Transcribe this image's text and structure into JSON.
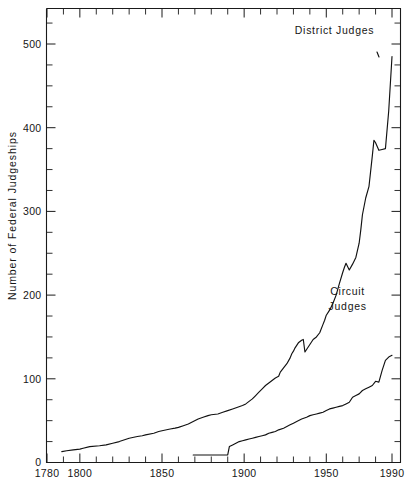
{
  "chart_data": {
    "type": "line",
    "title": "",
    "xlabel": "",
    "ylabel": "Number  of  Federal  Judgeships",
    "xlim": [
      1780,
      1995
    ],
    "ylim": [
      0,
      540
    ],
    "grid": false,
    "legend_position": "inline-annotation",
    "x_ticks_major": [
      1780,
      1800,
      1850,
      1900,
      1950,
      1990
    ],
    "x_tick_labels": [
      "1780",
      "1800",
      "1850",
      "1900",
      "1950",
      "1990"
    ],
    "x_tick_minor_step": 10,
    "y_ticks_major": [
      0,
      100,
      200,
      300,
      400,
      500
    ],
    "y_tick_labels": [
      "0",
      "100",
      "200",
      "300",
      "400",
      "500"
    ],
    "y_tick_minor_step": 25,
    "annotations": [
      {
        "text": "District  Judges",
        "x": 1955,
        "y": 512
      },
      {
        "text": "Circuit",
        "x": 1963,
        "y": 200
      },
      {
        "text": "Judges",
        "x": 1963,
        "y": 182
      }
    ],
    "series": [
      {
        "name": "District Judges",
        "label": "District  Judges",
        "color": "#111111",
        "x": [
          1789,
          1792,
          1796,
          1800,
          1802,
          1806,
          1812,
          1816,
          1820,
          1824,
          1830,
          1835,
          1838,
          1840,
          1845,
          1848,
          1850,
          1855,
          1858,
          1860,
          1863,
          1866,
          1869,
          1872,
          1875,
          1878,
          1880,
          1884,
          1887,
          1890,
          1893,
          1896,
          1899,
          1901,
          1903,
          1905,
          1907,
          1909,
          1911,
          1913,
          1915,
          1917,
          1919,
          1921,
          1922,
          1924,
          1926,
          1928,
          1929,
          1930,
          1931,
          1932,
          1933,
          1935,
          1936,
          1937,
          1938,
          1939,
          1940,
          1941,
          1942,
          1944,
          1946,
          1948,
          1949,
          1950,
          1952,
          1954,
          1956,
          1958,
          1960,
          1961,
          1962,
          1964,
          1966,
          1968,
          1970,
          1971,
          1972,
          1974,
          1976,
          1978,
          1979,
          1980,
          1982,
          1984,
          1986,
          1988,
          1990
        ],
        "y": [
          13,
          14,
          15,
          16,
          17,
          19,
          20,
          21,
          23,
          25,
          29,
          31,
          32,
          33,
          35,
          37,
          38,
          40,
          41,
          42,
          44,
          46,
          49,
          52,
          54,
          56,
          57,
          58,
          60,
          62,
          64,
          66,
          68,
          70,
          73,
          76,
          80,
          84,
          88,
          92,
          95,
          98,
          101,
          103,
          108,
          113,
          118,
          125,
          130,
          133,
          137,
          140,
          143,
          146,
          147,
          132,
          135,
          138,
          141,
          144,
          147,
          150,
          155,
          165,
          170,
          176,
          182,
          190,
          200,
          214,
          227,
          233,
          238,
          230,
          237,
          245,
          262,
          278,
          296,
          316,
          330,
          366,
          385,
          382,
          373,
          374,
          375,
          420,
          485
        ],
        "line_style": "solid"
      },
      {
        "name": "Circuit Judges",
        "label": "Circuit Judges",
        "color": "#111111",
        "x": [
          1869,
          1878,
          1882,
          1886,
          1890,
          1891,
          1893,
          1895,
          1897,
          1899,
          1901,
          1903,
          1905,
          1907,
          1909,
          1911,
          1913,
          1915,
          1917,
          1919,
          1921,
          1924,
          1926,
          1928,
          1930,
          1932,
          1935,
          1938,
          1940,
          1942,
          1944,
          1946,
          1948,
          1950,
          1952,
          1954,
          1956,
          1958,
          1960,
          1962,
          1964,
          1966,
          1968,
          1970,
          1972,
          1974,
          1976,
          1978,
          1980,
          1982,
          1984,
          1986,
          1988,
          1990
        ],
        "y": [
          9,
          9,
          9,
          9,
          9,
          19,
          21,
          23,
          25,
          26,
          27,
          28,
          29,
          30,
          31,
          32,
          33,
          35,
          36,
          37,
          39,
          41,
          43,
          45,
          47,
          49,
          52,
          54,
          56,
          57,
          58,
          59,
          60,
          62,
          64,
          65,
          66,
          67,
          68,
          70,
          72,
          78,
          80,
          82,
          86,
          88,
          90,
          92,
          97,
          96,
          110,
          122,
          126,
          128
        ],
        "line_style": "solid"
      }
    ]
  },
  "axes": {
    "y_axis_title": "Number  of  Federal  Judgeships"
  },
  "caption": {
    "text": ""
  }
}
